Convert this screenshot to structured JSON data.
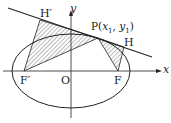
{
  "diagram": {
    "labels": {
      "h_prime": "H′",
      "y_axis": "y",
      "x_axis": "x",
      "p_prefix": "P(",
      "p_x": "x",
      "p_x_sub": "1",
      "p_sep": ", ",
      "p_y": "y",
      "p_y_sub": "1",
      "p_suffix": ")",
      "h": "H",
      "f_prime": "F′",
      "origin": "O",
      "f": "F"
    },
    "colors": {
      "stroke": "#222222",
      "hatch": "#444444",
      "background": "#ffffff"
    }
  }
}
